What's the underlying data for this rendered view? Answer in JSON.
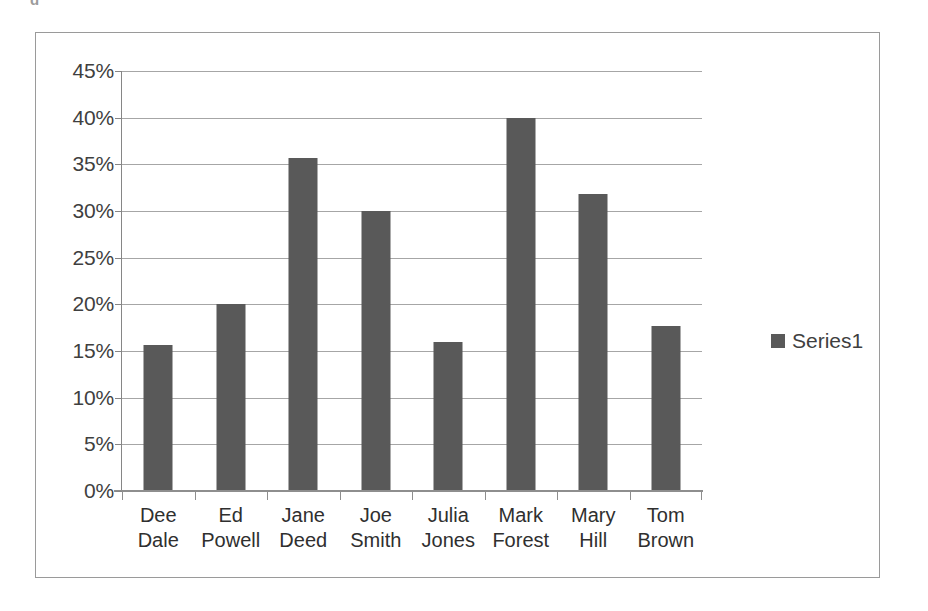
{
  "top_sliver_text": "g",
  "chart_data": {
    "type": "bar",
    "title": "",
    "subtitle": "",
    "xlabel": "",
    "ylabel": "",
    "categories": [
      "Dee Dale",
      "Ed Powell",
      "Jane Deed",
      "Joe Smith",
      "Julia Jones",
      "Mark Forest",
      "Mary Hill",
      "Tom Brown"
    ],
    "category_lines": [
      [
        "Dee",
        "Dale"
      ],
      [
        "Ed",
        "Powell"
      ],
      [
        "Jane",
        "Deed"
      ],
      [
        "Joe",
        "Smith"
      ],
      [
        "Julia",
        "Jones"
      ],
      [
        "Mark",
        "Forest"
      ],
      [
        "Mary",
        "Hill"
      ],
      [
        "Tom",
        "Brown"
      ]
    ],
    "series": [
      {
        "name": "Series1",
        "values": [
          15.6,
          20.0,
          35.7,
          30.0,
          16.0,
          40.0,
          31.8,
          17.7
        ],
        "color": "#595959"
      }
    ],
    "ylim": [
      0,
      45
    ],
    "ytick_step": 5,
    "ytick_labels": [
      "45%",
      "40%",
      "35%",
      "30%",
      "25%",
      "20%",
      "15%",
      "10%",
      "5%",
      "0%"
    ],
    "ytick_values": [
      45,
      40,
      35,
      30,
      25,
      20,
      15,
      10,
      5,
      0
    ],
    "grid": true,
    "grid_axis": "y",
    "legend": {
      "position": "right",
      "entries": [
        {
          "label": "Series1",
          "color": "#595959"
        }
      ]
    },
    "colors": {
      "bar": "#595959",
      "grid": "#a6a6a6",
      "axis": "#8e8e8e",
      "frame": "#9a9a9a",
      "text": "#3f3f3f",
      "background": "#ffffff"
    }
  }
}
